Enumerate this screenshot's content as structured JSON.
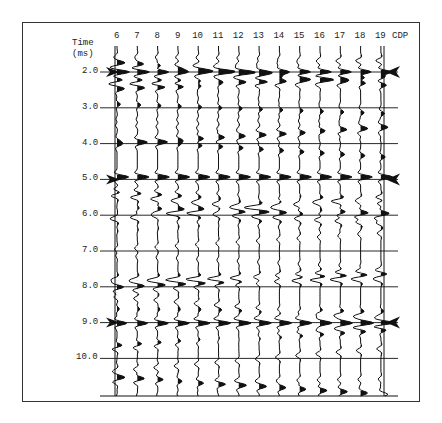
{
  "figure": {
    "axis_title_line1": "Time",
    "axis_title_line2": "(ms)",
    "cdp_label": "CDP",
    "cdp_numbers": [
      "6",
      "7",
      "8",
      "9",
      "10",
      "11",
      "12",
      "13",
      "14",
      "15",
      "16",
      "17",
      "18",
      "19"
    ],
    "time_labels": [
      "2.0",
      "3.0",
      "4.0",
      "5.0",
      "6.0",
      "7.0",
      "8.0",
      "9.0",
      "10.0"
    ],
    "reflector_arrows_at": [
      "2.0",
      "5.0",
      "9.0"
    ]
  },
  "colors": {
    "ink": "#111111",
    "frame": "#333333",
    "grid": "#bbbbbb"
  }
}
